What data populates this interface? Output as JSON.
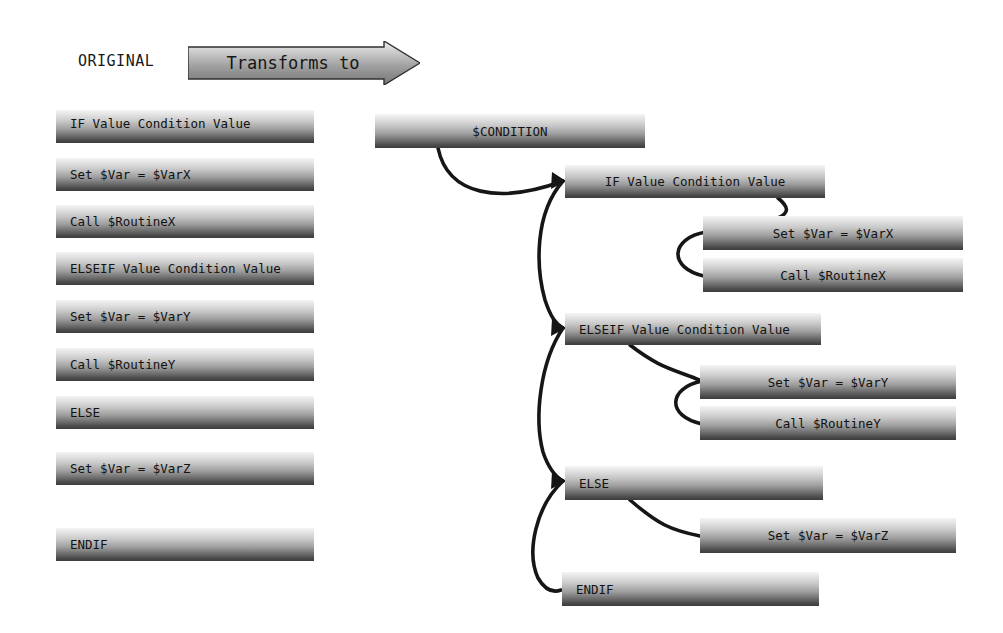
{
  "header": {
    "original_label": "ORIGINAL",
    "arrow_label": "Transforms to",
    "arrow_icon": "right-arrow-banner"
  },
  "colors": {
    "box_gradient_top": "#f4f4f4",
    "box_gradient_bottom": "#3c3c3c",
    "connector": "#1a1a1a",
    "text": "#121212",
    "background": "#ffffff"
  },
  "original_column": {
    "title": "ORIGINAL",
    "statements": [
      {
        "id": "orig-if",
        "text": "IF Value Condition Value"
      },
      {
        "id": "orig-set-x",
        "text": "Set $Var = $VarX"
      },
      {
        "id": "orig-call-x",
        "text": "Call $RoutineX"
      },
      {
        "id": "orig-elseif",
        "text": "ELSEIF Value Condition Value"
      },
      {
        "id": "orig-set-y",
        "text": "Set $Var = $VarY"
      },
      {
        "id": "orig-call-y",
        "text": "Call $RoutineY"
      },
      {
        "id": "orig-else",
        "text": "ELSE"
      },
      {
        "id": "orig-set-z",
        "text": "Set $Var = $VarZ"
      },
      {
        "id": "orig-endif",
        "text": "ENDIF"
      }
    ]
  },
  "transformed_column": {
    "root": {
      "id": "new-condition",
      "text": "$CONDITION"
    },
    "branches": [
      {
        "id": "new-if",
        "text": "IF Value Condition Value",
        "children": [
          {
            "id": "new-set-x",
            "text": "Set $Var = $VarX"
          },
          {
            "id": "new-call-x",
            "text": "Call $RoutineX"
          }
        ]
      },
      {
        "id": "new-elseif",
        "text": "ELSEIF Value Condition Value",
        "children": [
          {
            "id": "new-set-y",
            "text": "Set $Var = $VarY"
          },
          {
            "id": "new-call-y",
            "text": "Call $RoutineY"
          }
        ]
      },
      {
        "id": "new-else",
        "text": "ELSE",
        "children": [
          {
            "id": "new-set-z",
            "text": "Set $Var = $VarZ"
          }
        ]
      },
      {
        "id": "new-endif",
        "text": "ENDIF",
        "children": []
      }
    ]
  }
}
